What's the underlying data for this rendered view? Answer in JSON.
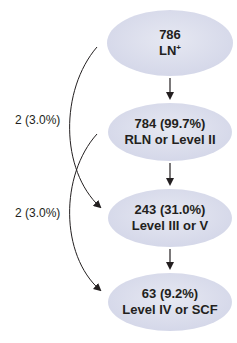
{
  "diagram": {
    "nodes": [
      {
        "id": "ln",
        "line1": "786",
        "line2": "LN",
        "line2_sup": "+"
      },
      {
        "id": "rln",
        "line1": "784 (99.7%)",
        "line2": "RLN or Level II"
      },
      {
        "id": "l3",
        "line1": "243 (31.0%)",
        "line2": "Level III or V"
      },
      {
        "id": "l4",
        "line1": "63 (9.2%)",
        "line2": "Level IV or SCF"
      }
    ],
    "skip_edges": [
      {
        "from": "ln",
        "to": "l3",
        "label": "2 (3.0%)"
      },
      {
        "from": "rln",
        "to": "l4",
        "label": "2 (3.0%)"
      }
    ],
    "colors": {
      "node_fill": "#d6d9ea",
      "node_fill_light": "#e6e8f2",
      "stroke": "#231f20"
    }
  }
}
